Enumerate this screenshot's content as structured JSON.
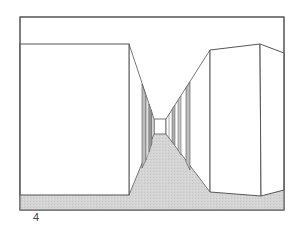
{
  "game": {
    "view": "first-person maze corridor",
    "level_number": "4"
  },
  "colors": {
    "wall": "#ffffff",
    "line": "#555555",
    "floor": "#d2d2d2",
    "wall_shade_dark": "#9a9a9a",
    "wall_shade_light": "#cfcfcf"
  }
}
